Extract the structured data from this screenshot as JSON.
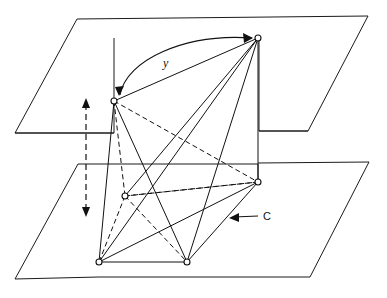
{
  "figure": {
    "type": "geometric-diagram",
    "canvas": {
      "width": 387,
      "height": 298
    },
    "background_color": "#ffffff",
    "line_color": "#111111"
  },
  "labels": {
    "y": "y",
    "c": "C"
  },
  "planes": [
    {
      "name": "upper-plane",
      "role": "top parallel plane",
      "outline_points": "77,19 368,16 308,131 259,131 259,38 114,38 114,133 15,133",
      "style": "solid"
    },
    {
      "name": "lower-plane",
      "role": "bottom parallel plane",
      "outline_points": "78,164 258,164 258,182 369,162 310,277 99,277 99,262 15,279",
      "style": "solid"
    }
  ],
  "vertices": [
    {
      "id": "T",
      "name": "top-vertex",
      "x": 258,
      "y": 38,
      "plane": "upper",
      "hidden": false
    },
    {
      "id": "L",
      "name": "left-vertex",
      "x": 114,
      "y": 101,
      "plane": "upper",
      "hidden": false
    },
    {
      "id": "R",
      "name": "right-vertex",
      "x": 258,
      "y": 182,
      "plane": "lower",
      "hidden": false
    },
    {
      "id": "H",
      "name": "hidden-vertex",
      "x": 125,
      "y": 196,
      "plane": "lower",
      "hidden": true
    },
    {
      "id": "B1",
      "name": "bottom-left-vertex",
      "x": 99,
      "y": 262,
      "plane": "lower",
      "hidden": false
    },
    {
      "id": "B2",
      "name": "bottom-right-vertex",
      "x": 187,
      "y": 262,
      "plane": "lower",
      "hidden": false
    }
  ],
  "edges": [
    {
      "from": "T",
      "to": "L",
      "style": "solid",
      "name": "edge-top-left"
    },
    {
      "from": "T",
      "to": "R",
      "style": "solid",
      "name": "edge-top-right"
    },
    {
      "from": "T",
      "to": "B1",
      "style": "solid",
      "name": "edge-top-bottomleft"
    },
    {
      "from": "T",
      "to": "B2",
      "style": "solid",
      "name": "edge-top-bottomright"
    },
    {
      "from": "T",
      "to": "H",
      "style": "solid",
      "name": "edge-top-hidden"
    },
    {
      "from": "L",
      "to": "B1",
      "style": "solid",
      "name": "edge-left-bottomleft"
    },
    {
      "from": "L",
      "to": "B2",
      "style": "solid",
      "name": "edge-left-bottomright"
    },
    {
      "from": "L",
      "to": "R",
      "style": "solid",
      "name": "edge-left-right"
    },
    {
      "from": "L",
      "to": "H",
      "style": "dashed",
      "name": "edge-left-hidden"
    },
    {
      "from": "R",
      "to": "B1",
      "style": "solid",
      "name": "edge-right-bottomleft"
    },
    {
      "from": "R",
      "to": "B2",
      "style": "solid",
      "name": "edge-right-bottomright"
    },
    {
      "from": "R",
      "to": "H",
      "style": "dashed",
      "name": "edge-right-hidden"
    },
    {
      "from": "H",
      "to": "B1",
      "style": "dashed",
      "name": "edge-hidden-bottomleft"
    },
    {
      "from": "H",
      "to": "B2",
      "style": "dashed",
      "name": "edge-hidden-bottomright"
    },
    {
      "from": "B1",
      "to": "B2",
      "style": "solid",
      "name": "edge-bottom-base"
    }
  ],
  "annotations": [
    {
      "name": "y-arrow",
      "label": "y",
      "label_x": 165,
      "label_y": 66,
      "description": "double-headed curved arrow between left vertex and top vertex",
      "from": "L",
      "to": "T"
    },
    {
      "name": "c-pointer",
      "label": "C",
      "label_x": 266,
      "label_y": 219,
      "description": "leader line with left arrowhead pointing at the polyhedron face",
      "arrow_tip_x": 230,
      "arrow_tip_y": 217,
      "arrow_tail_x": 260,
      "arrow_tail_y": 215
    },
    {
      "name": "separation-axis",
      "label": "",
      "description": "vertical dashed double-headed arrow showing separation between the two planes",
      "x": 86,
      "y_top": 99,
      "y_bottom": 216
    }
  ]
}
